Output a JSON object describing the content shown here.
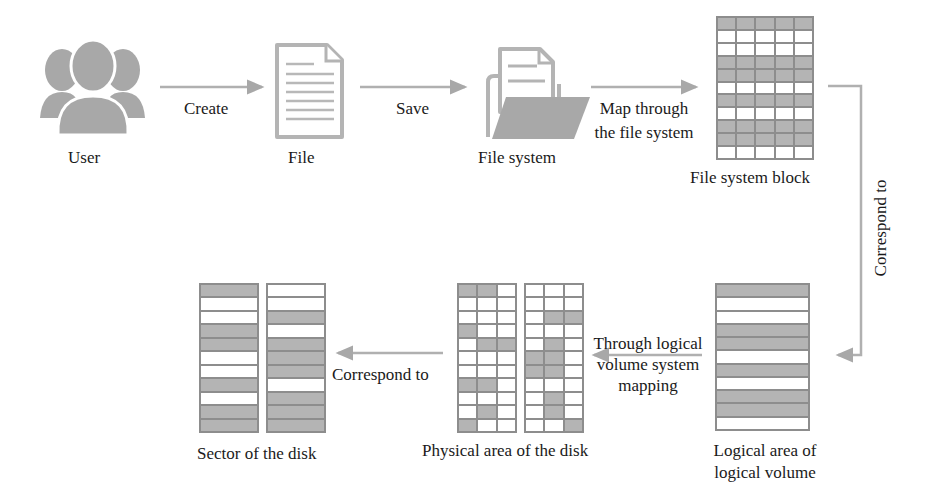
{
  "diagram": {
    "nodes": {
      "user": {
        "label": "User"
      },
      "file": {
        "label": "File"
      },
      "file_system": {
        "label": "File system"
      },
      "fs_block": {
        "label": "File system block"
      },
      "logical_volume": {
        "label_line1": "Logical area of",
        "label_line2": "logical volume"
      },
      "physical_area": {
        "label": "Physical area of the disk"
      },
      "disk_sector": {
        "label": "Sector of the disk"
      }
    },
    "edges": {
      "create": {
        "label": "Create"
      },
      "save": {
        "label": "Save"
      },
      "map_fs": {
        "label_line1": "Map through",
        "label_line2": "the file system"
      },
      "correspond_right": {
        "label": "Correspond to"
      },
      "lv_mapping": {
        "label_line1": "Through logical",
        "label_line2": "volume system",
        "label_line3": "mapping"
      },
      "correspond_bottom": {
        "label": "Correspond to"
      }
    },
    "colors": {
      "icon_gray": "#a8a8a8",
      "arrow_gray": "#b0b0b0",
      "filled_cell": "#b4b4b4",
      "grid_line": "#8d8d8d"
    },
    "grids": {
      "fs_block": {
        "rows": 11,
        "cols": 5,
        "pattern": [
          [
            1,
            1,
            1,
            1,
            1
          ],
          [
            0,
            0,
            0,
            0,
            0
          ],
          [
            0,
            0,
            0,
            0,
            0
          ],
          [
            1,
            1,
            1,
            1,
            1
          ],
          [
            1,
            1,
            1,
            1,
            1
          ],
          [
            0,
            0,
            0,
            0,
            0
          ],
          [
            1,
            1,
            1,
            1,
            1
          ],
          [
            0,
            0,
            0,
            0,
            0
          ],
          [
            1,
            1,
            1,
            1,
            1
          ],
          [
            1,
            1,
            1,
            1,
            1
          ],
          [
            0,
            0,
            0,
            0,
            0
          ]
        ]
      },
      "logical_volume": {
        "rows": 11,
        "cols": 1,
        "pattern": [
          [
            1
          ],
          [
            0
          ],
          [
            0
          ],
          [
            1
          ],
          [
            1
          ],
          [
            0
          ],
          [
            1
          ],
          [
            0
          ],
          [
            1
          ],
          [
            1
          ],
          [
            0
          ]
        ]
      },
      "physical_left": {
        "rows": 11,
        "cols": 3,
        "pattern": [
          [
            1,
            1,
            0
          ],
          [
            0,
            0,
            0
          ],
          [
            0,
            0,
            0
          ],
          [
            1,
            0,
            0
          ],
          [
            0,
            1,
            1
          ],
          [
            0,
            0,
            0
          ],
          [
            0,
            0,
            0
          ],
          [
            1,
            1,
            0
          ],
          [
            0,
            0,
            0
          ],
          [
            0,
            1,
            0
          ],
          [
            1,
            0,
            0
          ]
        ]
      },
      "physical_right": {
        "rows": 11,
        "cols": 3,
        "pattern": [
          [
            0,
            0,
            0
          ],
          [
            0,
            0,
            0
          ],
          [
            0,
            1,
            1
          ],
          [
            0,
            0,
            0
          ],
          [
            0,
            1,
            0
          ],
          [
            1,
            1,
            0
          ],
          [
            1,
            1,
            0
          ],
          [
            0,
            0,
            0
          ],
          [
            0,
            1,
            0
          ],
          [
            0,
            1,
            0
          ],
          [
            0,
            0,
            1
          ]
        ]
      },
      "sector_left": {
        "rows": 11,
        "cols": 1,
        "pattern": [
          [
            1
          ],
          [
            0
          ],
          [
            0
          ],
          [
            1
          ],
          [
            1
          ],
          [
            0
          ],
          [
            0
          ],
          [
            1
          ],
          [
            0
          ],
          [
            1
          ],
          [
            1
          ]
        ]
      },
      "sector_right": {
        "rows": 11,
        "cols": 1,
        "pattern": [
          [
            0
          ],
          [
            0
          ],
          [
            1
          ],
          [
            0
          ],
          [
            1
          ],
          [
            1
          ],
          [
            1
          ],
          [
            0
          ],
          [
            1
          ],
          [
            1
          ],
          [
            1
          ]
        ]
      }
    }
  }
}
